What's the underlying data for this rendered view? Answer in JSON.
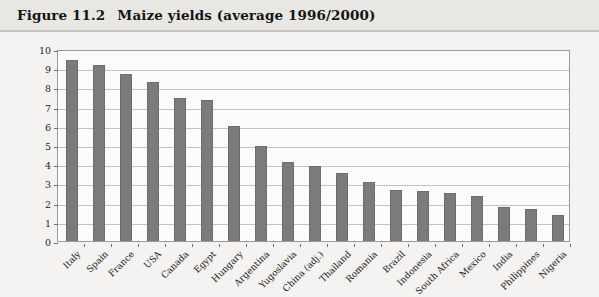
{
  "figure": {
    "number": "Figure 11.2",
    "title": "Maize yields (average 1996/2000)"
  },
  "colors": {
    "bar": "#7b7b7b",
    "grid": "#c2c2c0",
    "frame": "#9a9a98",
    "page_background": "#f4f3f1",
    "header_background": "#e9e7e4",
    "plot_background": "#fbfbfa"
  },
  "chart_data": {
    "type": "bar",
    "title": "Maize yields (average 1996/2000)",
    "xlabel": "",
    "ylabel": "Tonnes/ha",
    "ylim": [
      0,
      10
    ],
    "yticks": [
      0,
      1,
      2,
      3,
      4,
      5,
      6,
      7,
      8,
      9,
      10
    ],
    "ytick_labels": [
      "0",
      "1",
      "2",
      "3",
      "4",
      "5",
      "6",
      "7",
      "8",
      "9",
      "10"
    ],
    "grid": true,
    "legend": null,
    "categories": [
      "Italy",
      "Spain",
      "France",
      "USA",
      "Canada",
      "Egypt",
      "Hungary",
      "Argentina",
      "Yugoslavia",
      "China (adj.)",
      "Thailand",
      "Romania",
      "Brazil",
      "Indonesia",
      "South Africa",
      "Mexico",
      "India",
      "Philippines",
      "Nigeria"
    ],
    "values": [
      9.45,
      9.17,
      8.72,
      8.3,
      7.43,
      7.35,
      6.0,
      4.97,
      4.11,
      3.89,
      3.55,
      3.05,
      2.65,
      2.61,
      2.49,
      2.34,
      1.78,
      1.67,
      1.36
    ]
  }
}
